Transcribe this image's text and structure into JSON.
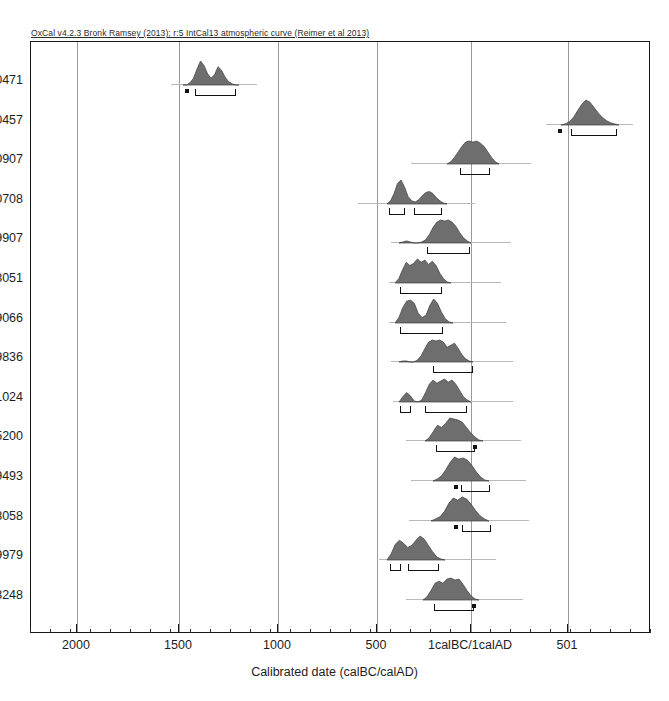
{
  "caption": "OxCal v4.2.3 Bronk Ramsey (2013); r:5 IntCal13 atmospheric curve (Reimer et al 2013)",
  "axis": {
    "title": "Calibrated date (calBC/calAD)",
    "ticks": [
      {
        "label": "2000",
        "x": 76
      },
      {
        "label": "1500",
        "x": 178
      },
      {
        "label": "1000",
        "x": 277
      },
      {
        "label": "500",
        "x": 376
      },
      {
        "label": "1calBC/1calAD",
        "x": 470
      },
      {
        "label": "501",
        "x": 567
      }
    ],
    "minor_step": 20,
    "plot_left": 30,
    "plot_right": 650
  },
  "gridlines": [
    76,
    178,
    277,
    376,
    470,
    567
  ],
  "style": {
    "curve_fill": "#6e6e6e",
    "curve_stroke": "#3d3d3d",
    "grid_color": "#9a9a9a",
    "frame_color": "#161616",
    "baseline_color": "#b9b9b9"
  },
  "chart_data": {
    "type": "area",
    "title": "OxCal v4.2.3 Bronk Ramsey (2013); r:5 IntCal13 atmospheric curve (Reimer et al 2013)",
    "xlabel": "Calibrated date (calBC/calAD)",
    "ylabel": "",
    "grid": true,
    "legend": "none",
    "axis_direction": "reversed-bc-to-ad",
    "xlim": [
      2250,
      700
    ],
    "series": [
      {
        "name": "R_Date 120471",
        "baseline": [
          170,
          256
        ],
        "curve_x0": 182,
        "curve_w": 56,
        "curve_h": 24,
        "profile": [
          0,
          0,
          2,
          6,
          14,
          21,
          17,
          10,
          6,
          9,
          16,
          13,
          7,
          3,
          1,
          0,
          0
        ],
        "bars": [
          {
            "x0": 194,
            "x1": 235
          }
        ],
        "dots": [
          184
        ]
      },
      {
        "name": "R_Date 120457",
        "baseline": [
          545,
          632
        ],
        "curve_x0": 560,
        "curve_w": 58,
        "curve_h": 25,
        "profile": [
          0,
          1,
          3,
          7,
          13,
          19,
          23,
          21,
          16,
          11,
          7,
          4,
          2,
          1,
          0
        ],
        "bars": [
          {
            "x0": 570,
            "x1": 616
          }
        ],
        "dots": [
          557
        ]
      },
      {
        "name": "R_Date 120907",
        "baseline": [
          410,
          530
        ],
        "curve_x0": 446,
        "curve_w": 52,
        "curve_h": 23,
        "profile": [
          0,
          2,
          6,
          11,
          16,
          20,
          21,
          20,
          21,
          19,
          16,
          11,
          6,
          2,
          0
        ],
        "bars": [
          {
            "x0": 459,
            "x1": 489
          }
        ],
        "dots": []
      },
      {
        "name": "R_Date 120708",
        "baseline": [
          357,
          474
        ],
        "curve_x0": 386,
        "curve_w": 60,
        "curve_h": 24,
        "profile": [
          0,
          3,
          10,
          20,
          23,
          16,
          7,
          3,
          2,
          4,
          8,
          11,
          12,
          10,
          6,
          3,
          1,
          0
        ],
        "bars": [
          {
            "x0": 388,
            "x1": 404
          },
          {
            "x0": 413,
            "x1": 441
          }
        ],
        "dots": []
      },
      {
        "name": "R_Date 119907",
        "baseline": [
          390,
          510
        ],
        "curve_x0": 398,
        "curve_w": 72,
        "curve_h": 23,
        "profile": [
          0,
          1,
          2,
          1,
          0,
          0,
          1,
          3,
          8,
          15,
          20,
          22,
          21,
          22,
          20,
          16,
          10,
          5,
          2,
          0
        ],
        "bars": [
          {
            "x0": 426,
            "x1": 469
          }
        ],
        "dots": []
      },
      {
        "name": "R_Date 88051",
        "baseline": [
          388,
          500
        ],
        "curve_x0": 394,
        "curve_w": 56,
        "curve_h": 24,
        "profile": [
          0,
          4,
          12,
          19,
          16,
          18,
          22,
          19,
          21,
          17,
          20,
          16,
          9,
          4,
          1,
          0
        ],
        "bars": [
          {
            "x0": 399,
            "x1": 441
          }
        ],
        "dots": []
      },
      {
        "name": "R_Date 119066",
        "baseline": [
          388,
          505
        ],
        "curve_x0": 394,
        "curve_w": 58,
        "curve_h": 24,
        "profile": [
          0,
          5,
          14,
          20,
          21,
          18,
          9,
          5,
          7,
          16,
          22,
          18,
          10,
          4,
          1,
          0
        ],
        "bars": [
          {
            "x0": 399,
            "x1": 442
          }
        ],
        "dots": []
      },
      {
        "name": "R_Date 119836",
        "baseline": [
          390,
          512
        ],
        "curve_x0": 398,
        "curve_w": 74,
        "curve_h": 22,
        "profile": [
          0,
          1,
          1,
          0,
          0,
          2,
          6,
          13,
          19,
          21,
          20,
          21,
          19,
          14,
          16,
          18,
          13,
          7,
          3,
          1,
          0
        ],
        "bars": [
          {
            "x0": 432,
            "x1": 472
          }
        ],
        "dots": []
      },
      {
        "name": "R_Date 31024",
        "baseline": [
          392,
          512
        ],
        "curve_x0": 398,
        "curve_w": 72,
        "curve_h": 23,
        "profile": [
          0,
          5,
          9,
          6,
          1,
          0,
          2,
          9,
          17,
          21,
          18,
          20,
          22,
          19,
          21,
          17,
          11,
          5,
          2,
          0
        ],
        "bars": [
          {
            "x0": 399,
            "x1": 410
          },
          {
            "x0": 424,
            "x1": 466
          }
        ],
        "dots": []
      },
      {
        "name": "R_Date 25200",
        "baseline": [
          405,
          520
        ],
        "curve_x0": 424,
        "curve_w": 58,
        "curve_h": 23,
        "profile": [
          0,
          3,
          9,
          15,
          13,
          17,
          22,
          21,
          20,
          18,
          13,
          8,
          4,
          1,
          0
        ],
        "bars": [
          {
            "x0": 435,
            "x1": 474
          }
        ],
        "dots": [
          472
        ]
      },
      {
        "name": "R_Date 9493",
        "baseline": [
          410,
          525
        ],
        "curve_x0": 432,
        "curve_w": 56,
        "curve_h": 24,
        "profile": [
          0,
          2,
          5,
          11,
          18,
          23,
          21,
          22,
          20,
          15,
          9,
          4,
          1,
          0
        ],
        "bars": [
          {
            "x0": 460,
            "x1": 489
          }
        ],
        "dots": [
          453
        ]
      },
      {
        "name": "R_Date 118058",
        "baseline": [
          408,
          528
        ],
        "curve_x0": 430,
        "curve_w": 58,
        "curve_h": 24,
        "profile": [
          0,
          2,
          4,
          9,
          17,
          22,
          20,
          23,
          21,
          16,
          10,
          5,
          2,
          0
        ],
        "bars": [
          {
            "x0": 461,
            "x1": 490
          }
        ],
        "dots": [
          453
        ]
      },
      {
        "name": "R_Date 9979",
        "baseline": [
          378,
          495
        ],
        "curve_x0": 386,
        "curve_w": 58,
        "curve_h": 24,
        "profile": [
          0,
          6,
          15,
          19,
          16,
          12,
          14,
          19,
          23,
          20,
          14,
          8,
          3,
          1,
          0
        ],
        "bars": [
          {
            "x0": 389,
            "x1": 400
          },
          {
            "x0": 407,
            "x1": 438
          }
        ],
        "dots": []
      },
      {
        "name": "R_Date 3248",
        "baseline": [
          405,
          522
        ],
        "curve_x0": 422,
        "curve_w": 56,
        "curve_h": 22,
        "profile": [
          0,
          3,
          9,
          16,
          18,
          16,
          20,
          21,
          19,
          20,
          15,
          9,
          4,
          1,
          0
        ],
        "bars": [
          {
            "x0": 433,
            "x1": 473
          }
        ],
        "dots": [
          471
        ]
      }
    ]
  }
}
